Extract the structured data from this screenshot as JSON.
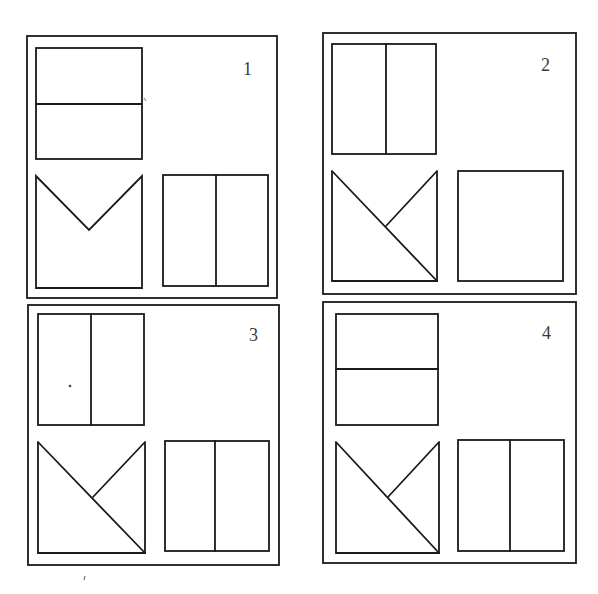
{
  "figure": {
    "stroke_color": "#1a1a1a",
    "background": "#ffffff",
    "panels": [
      {
        "label": "1",
        "outer": {
          "x": 27,
          "y": 36,
          "w": 250,
          "h": 262
        },
        "label_pos": {
          "x": 243,
          "y": 60
        },
        "top_shape": {
          "type": "rect-split-horizontal",
          "x": 36,
          "y": 48,
          "w": 106,
          "h": 111,
          "divider": 104
        },
        "bottom_left_shape": {
          "type": "square-v-notch",
          "x": 36,
          "y": 176,
          "w": 106,
          "h": 112,
          "apex": [
            89,
            230
          ]
        },
        "bottom_right_shape": {
          "type": "rect-split-vertical",
          "x": 163,
          "y": 175,
          "w": 105,
          "h": 111,
          "divider": 216
        }
      },
      {
        "label": "2",
        "outer": {
          "x": 323,
          "y": 33,
          "w": 253,
          "h": 261
        },
        "label_pos": {
          "x": 541,
          "y": 56
        },
        "top_shape": {
          "type": "rect-split-vertical",
          "x": 332,
          "y": 44,
          "w": 104,
          "h": 110,
          "divider": 386
        },
        "bottom_left_shape": {
          "type": "square-k-diagonal",
          "x": 332,
          "y": 171,
          "w": 105,
          "h": 110,
          "branch": [
            386,
            226
          ]
        },
        "bottom_right_shape": {
          "type": "rect-plain",
          "x": 458,
          "y": 171,
          "w": 105,
          "h": 110
        }
      },
      {
        "label": "3",
        "outer": {
          "x": 28,
          "y": 305,
          "w": 251,
          "h": 260
        },
        "label_pos": {
          "x": 249,
          "y": 326
        },
        "top_shape": {
          "type": "rect-split-vertical",
          "x": 38,
          "y": 314,
          "w": 106,
          "h": 111,
          "divider": 91
        },
        "bottom_left_shape": {
          "type": "square-k-diagonal",
          "x": 38,
          "y": 442,
          "w": 107,
          "h": 111,
          "branch": [
            93,
            497
          ]
        },
        "bottom_right_shape": {
          "type": "rect-split-vertical",
          "x": 165,
          "y": 441,
          "w": 104,
          "h": 110,
          "divider": 215
        }
      },
      {
        "label": "4",
        "outer": {
          "x": 323,
          "y": 302,
          "w": 253,
          "h": 261
        },
        "label_pos": {
          "x": 542,
          "y": 324
        },
        "top_shape": {
          "type": "rect-split-horizontal",
          "x": 336,
          "y": 314,
          "w": 102,
          "h": 111,
          "divider": 369
        },
        "bottom_left_shape": {
          "type": "square-k-diagonal",
          "x": 336,
          "y": 442,
          "w": 103,
          "h": 111,
          "branch": [
            388,
            497
          ]
        },
        "bottom_right_shape": {
          "type": "rect-split-vertical",
          "x": 458,
          "y": 440,
          "w": 106,
          "h": 111,
          "divider": 510
        }
      }
    ]
  }
}
